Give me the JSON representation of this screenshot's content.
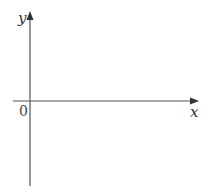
{
  "diagram": {
    "type": "coordinate-axes",
    "x_axis_label": "x",
    "y_axis_label": "y",
    "origin_label": "0",
    "axis_color": "#555555"
  }
}
